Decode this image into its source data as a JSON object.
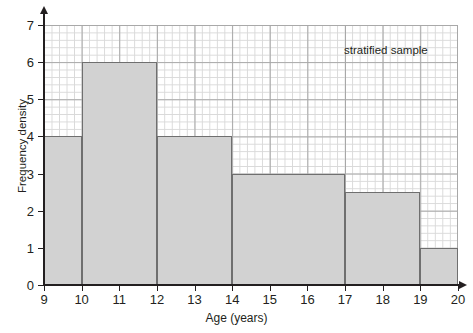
{
  "chart_data": {
    "type": "bar",
    "title": "",
    "subtitle": "",
    "xlabel": "Age (years)",
    "ylabel": "Frequency density",
    "xlim": [
      9,
      20
    ],
    "ylim": [
      0,
      7
    ],
    "grid": true,
    "legend_position": "none",
    "annotations": [
      {
        "text": "stratified sample",
        "x": 18.8,
        "y": 6.5
      }
    ],
    "x_ticks": [
      "9",
      "10",
      "11",
      "12",
      "13",
      "14",
      "15",
      "16",
      "17",
      "18",
      "19",
      "20"
    ],
    "x_tick_values": [
      9,
      10,
      11,
      12,
      13,
      14,
      15,
      16,
      17,
      18,
      19,
      20
    ],
    "y_ticks": [
      "0",
      "1",
      "2",
      "3",
      "4",
      "5",
      "6",
      "7"
    ],
    "y_tick_values": [
      0,
      1,
      2,
      3,
      4,
      5,
      6,
      7
    ],
    "bins": [
      {
        "label": "9-10",
        "start": 9,
        "end": 10,
        "value": 4
      },
      {
        "label": "10-12",
        "start": 10,
        "end": 12,
        "value": 6
      },
      {
        "label": "12-14",
        "start": 12,
        "end": 14,
        "value": 4
      },
      {
        "label": "14-17",
        "start": 14,
        "end": 17,
        "value": 3
      },
      {
        "label": "17-19",
        "start": 17,
        "end": 19,
        "value": 2.5
      },
      {
        "label": "19-20",
        "start": 19,
        "end": 20,
        "value": 1
      }
    ],
    "categories": [
      "9-10",
      "10-12",
      "12-14",
      "14-17",
      "17-19",
      "19-20"
    ],
    "values": [
      4,
      6,
      4,
      3,
      2.5,
      1
    ],
    "colors": {
      "bar_fill": "#d2d2d2",
      "bar_edge": "#6f6f6f",
      "grid_fine": "#d9d9d9",
      "grid_heavy": "#a8a8a8",
      "axis": "#231f20",
      "text": "#231f20",
      "background": "#ffffff"
    }
  }
}
